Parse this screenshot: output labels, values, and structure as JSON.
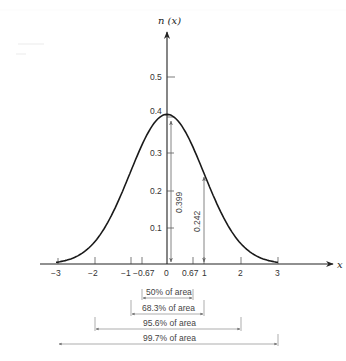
{
  "figure": {
    "y_axis_label": "n (x)",
    "x_axis_label": "x"
  },
  "chart_data": {
    "type": "line",
    "title": "",
    "xlabel": "x",
    "ylabel": "n (x)",
    "xlim": [
      -3.3,
      4.3
    ],
    "ylim": [
      0,
      0.6
    ],
    "grid": false,
    "x_ticks": [
      "−3",
      "−2",
      "−1",
      "−0.67",
      "0",
      "0.67",
      "1",
      "2",
      "3"
    ],
    "x_tick_values": [
      -3,
      -2,
      -1,
      -0.67,
      0,
      0.67,
      1,
      2,
      3
    ],
    "y_ticks": [
      "0.1",
      "0.2",
      "0.3",
      "0.4",
      "0.5"
    ],
    "y_tick_values": [
      0.1,
      0.2,
      0.3,
      0.4,
      0.5
    ],
    "series": [
      {
        "name": "n(x)",
        "x": [
          -3,
          -2.5,
          -2,
          -1.5,
          -1,
          -0.67,
          -0.5,
          0,
          0.5,
          0.67,
          1,
          1.5,
          2,
          2.5,
          3
        ],
        "values": [
          0.004,
          0.018,
          0.054,
          0.13,
          0.242,
          0.319,
          0.352,
          0.399,
          0.352,
          0.319,
          0.242,
          0.13,
          0.054,
          0.018,
          0.004
        ]
      }
    ],
    "annotations": [
      {
        "type": "vertical-dimension",
        "x": 0.1,
        "from": 0,
        "to": 0.399,
        "label": "0.399"
      },
      {
        "type": "vertical-dimension",
        "x": 1,
        "from": 0,
        "to": 0.242,
        "label": "0.242"
      },
      {
        "type": "interval",
        "from": -0.67,
        "to": 0.67,
        "label": "50% of area"
      },
      {
        "type": "interval",
        "from": -1,
        "to": 1,
        "label": "68.3% of area"
      },
      {
        "type": "interval",
        "from": -2,
        "to": 2,
        "label": "95.6% of area"
      },
      {
        "type": "interval",
        "from": -3,
        "to": 3,
        "label": "99.7% of area"
      }
    ]
  },
  "labels": {
    "y_axis": "n (x)",
    "x_axis": "x",
    "x_ticks": {
      "m3": "−3",
      "m2": "−2",
      "m1": "−1",
      "m067": "−0.67",
      "zero": "0",
      "p067": "0.67",
      "p1": "1",
      "p2": "2",
      "p3": "3"
    },
    "y_ticks": {
      "t1": "0.1",
      "t2": "0.2",
      "t3": "0.3",
      "t4": "0.4",
      "t5": "0.5"
    },
    "peak_value": "0.399",
    "one_sigma_value": "0.242",
    "areas": {
      "a50": "50% of area",
      "a683": "68.3% of area",
      "a956": "95.6% of area",
      "a997": "99.7% of area"
    }
  }
}
